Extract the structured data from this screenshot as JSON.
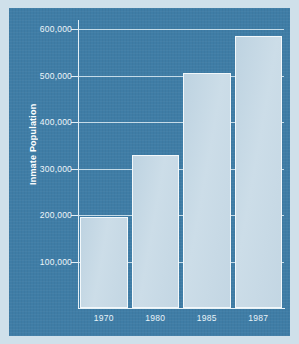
{
  "chart_data": {
    "type": "bar",
    "title": "",
    "xlabel": "",
    "ylabel": "Inmate Population",
    "categories": [
      "1970",
      "1980",
      "1985",
      "1987"
    ],
    "values": [
      196000,
      330000,
      505000,
      585000
    ],
    "ytick_labels": [
      "100,000",
      "200,000",
      "300,000",
      "400,000",
      "500,000",
      "600,000"
    ],
    "ytick_values": [
      100000,
      200000,
      300000,
      400000,
      500000,
      600000
    ],
    "ylim": [
      0,
      620000
    ],
    "grid": true,
    "legend": "none",
    "colors": {
      "panel_background": "#3f7da6",
      "outer_border": "#cfe0ea",
      "bar_fill": "#c6d9e5",
      "bar_edge": "#f2f8fb",
      "gridline": "#dcebf3",
      "text": "#eef5f9"
    }
  }
}
